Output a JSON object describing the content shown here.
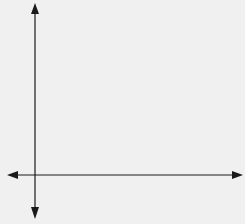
{
  "diagram": {
    "type": "coordinate-axes",
    "background_color": "#f0f0f0",
    "axis_color": "#1a1a1a",
    "x_axis": {
      "y": 175,
      "x_start": 7,
      "x_end": 243,
      "arrows": "both"
    },
    "y_axis": {
      "x": 35,
      "y_start": 3,
      "y_end": 218,
      "arrows": "both"
    },
    "labels": []
  }
}
